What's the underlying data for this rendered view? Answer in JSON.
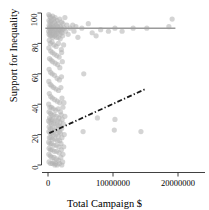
{
  "chart_data": {
    "type": "scatter",
    "title": "",
    "xlabel": "Total Campaign $",
    "ylabel": "Support for Inequality",
    "xlim": [
      -1200000,
      24000000
    ],
    "ylim": [
      -6,
      104
    ],
    "xticks": [
      0,
      10000000,
      20000000
    ],
    "xticklabels": [
      "0",
      "10000000",
      "20000000"
    ],
    "yticks": [
      0,
      20,
      40,
      60,
      80,
      100
    ],
    "yticklabels": [
      "0",
      "20",
      "40",
      "60",
      "80",
      "100"
    ],
    "grid": false,
    "legend": null,
    "point_color": "#b0b0b0",
    "point_opacity": 0.55,
    "point_radius": 2.6,
    "series": [
      {
        "name": "observations",
        "marker": "circle",
        "points": [
          [
            120000,
            99
          ],
          [
            250000,
            98
          ],
          [
            400000,
            97
          ],
          [
            700000,
            98
          ],
          [
            900000,
            96
          ],
          [
            1100000,
            97
          ],
          [
            1400000,
            95
          ],
          [
            1800000,
            96
          ],
          [
            2100000,
            94
          ],
          [
            2600000,
            97
          ],
          [
            150000,
            95
          ],
          [
            330000,
            94
          ],
          [
            520000,
            95
          ],
          [
            760000,
            93
          ],
          [
            1000000,
            94
          ],
          [
            1250000,
            92
          ],
          [
            1550000,
            93
          ],
          [
            1900000,
            91
          ],
          [
            2300000,
            93
          ],
          [
            2900000,
            92
          ],
          [
            180000,
            92
          ],
          [
            300000,
            91
          ],
          [
            480000,
            92
          ],
          [
            640000,
            90
          ],
          [
            850000,
            91
          ],
          [
            1150000,
            90
          ],
          [
            1450000,
            91
          ],
          [
            1700000,
            89
          ],
          [
            2000000,
            90
          ],
          [
            2500000,
            90
          ],
          [
            210000,
            90
          ],
          [
            360000,
            89
          ],
          [
            560000,
            90
          ],
          [
            800000,
            88
          ],
          [
            1050000,
            89
          ],
          [
            1300000,
            88
          ],
          [
            1600000,
            89
          ],
          [
            1950000,
            88
          ],
          [
            2200000,
            89
          ],
          [
            2700000,
            88
          ],
          [
            100000,
            88
          ],
          [
            280000,
            87
          ],
          [
            430000,
            88
          ],
          [
            690000,
            86
          ],
          [
            980000,
            87
          ],
          [
            1220000,
            86
          ],
          [
            1520000,
            87
          ],
          [
            1850000,
            86
          ],
          [
            2150000,
            87
          ],
          [
            3100000,
            86
          ],
          [
            160000,
            86
          ],
          [
            320000,
            85
          ],
          [
            500000,
            85
          ],
          [
            730000,
            84
          ],
          [
            1020000,
            85
          ],
          [
            1280000,
            84
          ],
          [
            1580000,
            84
          ],
          [
            1880000,
            83
          ],
          [
            2250000,
            85
          ],
          [
            3400000,
            90
          ],
          [
            3800000,
            92
          ],
          [
            4000000,
            88
          ],
          [
            4300000,
            91
          ],
          [
            4600000,
            84
          ],
          [
            5200000,
            90
          ],
          [
            6200000,
            93
          ],
          [
            6800000,
            87
          ],
          [
            7400000,
            85
          ],
          [
            8100000,
            89
          ],
          [
            9300000,
            88
          ],
          [
            10300000,
            90
          ],
          [
            11400000,
            88
          ],
          [
            13100000,
            90
          ],
          [
            15200000,
            90
          ],
          [
            18600000,
            91
          ],
          [
            19100000,
            96
          ],
          [
            190000,
            82
          ],
          [
            350000,
            80
          ],
          [
            620000,
            81
          ],
          [
            900000,
            79
          ],
          [
            1250000,
            78
          ],
          [
            1600000,
            80
          ],
          [
            2050000,
            76
          ],
          [
            2400000,
            79
          ],
          [
            140000,
            77
          ],
          [
            410000,
            75
          ],
          [
            660000,
            74
          ],
          [
            980000,
            73
          ],
          [
            1350000,
            72
          ],
          [
            1720000,
            71
          ],
          [
            2100000,
            74
          ],
          [
            230000,
            70
          ],
          [
            470000,
            69
          ],
          [
            720000,
            68
          ],
          [
            1100000,
            67
          ],
          [
            1480000,
            66
          ],
          [
            1820000,
            64
          ],
          [
            2200000,
            68
          ],
          [
            170000,
            63
          ],
          [
            390000,
            61
          ],
          [
            640000,
            60
          ],
          [
            1000000,
            59
          ],
          [
            1400000,
            57
          ],
          [
            1750000,
            56
          ],
          [
            2080000,
            58
          ],
          [
            5500000,
            60
          ],
          [
            130000,
            55
          ],
          [
            340000,
            53
          ],
          [
            580000,
            52
          ],
          [
            870000,
            51
          ],
          [
            1220000,
            50
          ],
          [
            1620000,
            49
          ],
          [
            1980000,
            51
          ],
          [
            200000,
            47
          ],
          [
            420000,
            45
          ],
          [
            670000,
            44
          ],
          [
            1030000,
            43
          ],
          [
            1420000,
            42
          ],
          [
            1800000,
            41
          ],
          [
            2150000,
            44
          ],
          [
            2450000,
            41
          ],
          [
            110000,
            40
          ],
          [
            300000,
            38
          ],
          [
            540000,
            38
          ],
          [
            810000,
            37
          ],
          [
            1180000,
            36
          ],
          [
            1560000,
            37
          ],
          [
            1920000,
            35
          ],
          [
            2300000,
            38
          ],
          [
            160000,
            35
          ],
          [
            370000,
            34
          ],
          [
            600000,
            33
          ],
          [
            930000,
            33
          ],
          [
            1300000,
            32
          ],
          [
            1680000,
            31
          ],
          [
            2030000,
            33
          ],
          [
            2600000,
            32
          ],
          [
            240000,
            31
          ],
          [
            460000,
            30
          ],
          [
            700000,
            30
          ],
          [
            1060000,
            29
          ],
          [
            1450000,
            29
          ],
          [
            1830000,
            28
          ],
          [
            2180000,
            30
          ],
          [
            7600000,
            31
          ],
          [
            10300000,
            30
          ],
          [
            100000,
            29
          ],
          [
            290000,
            28
          ],
          [
            520000,
            27
          ],
          [
            880000,
            27
          ],
          [
            1240000,
            26
          ],
          [
            1600000,
            26
          ],
          [
            1960000,
            25
          ],
          [
            2350000,
            27
          ],
          [
            180000,
            25
          ],
          [
            400000,
            24
          ],
          [
            650000,
            24
          ],
          [
            990000,
            23
          ],
          [
            1380000,
            23
          ],
          [
            1740000,
            22
          ],
          [
            2100000,
            24
          ],
          [
            5400000,
            22
          ],
          [
            10200000,
            23
          ],
          [
            14300000,
            22
          ],
          [
            140000,
            22
          ],
          [
            330000,
            21
          ],
          [
            570000,
            21
          ],
          [
            850000,
            20
          ],
          [
            1200000,
            20
          ],
          [
            1580000,
            19
          ],
          [
            1940000,
            21
          ],
          [
            2500000,
            20
          ],
          [
            210000,
            18
          ],
          [
            440000,
            18
          ],
          [
            690000,
            17
          ],
          [
            1060000,
            17
          ],
          [
            1430000,
            16
          ],
          [
            1790000,
            16
          ],
          [
            2140000,
            18
          ],
          [
            120000,
            15
          ],
          [
            310000,
            14
          ],
          [
            550000,
            14
          ],
          [
            900000,
            13
          ],
          [
            1270000,
            13
          ],
          [
            1650000,
            12
          ],
          [
            2000000,
            14
          ],
          [
            2420000,
            12
          ],
          [
            170000,
            11
          ],
          [
            380000,
            10
          ],
          [
            620000,
            10
          ],
          [
            960000,
            9
          ],
          [
            1330000,
            9
          ],
          [
            1700000,
            8
          ],
          [
            2060000,
            10
          ],
          [
            2300000,
            7
          ],
          [
            130000,
            7
          ],
          [
            350000,
            6
          ],
          [
            590000,
            5
          ],
          [
            920000,
            5
          ],
          [
            1290000,
            4
          ],
          [
            1620000,
            3
          ],
          [
            1980000,
            5
          ],
          [
            2250000,
            2
          ],
          [
            160000,
            2
          ],
          [
            400000,
            1
          ],
          [
            680000,
            1
          ],
          [
            1050000,
            0
          ],
          [
            1400000,
            0
          ],
          [
            1760000,
            1
          ],
          [
            2120000,
            0
          ],
          [
            900000,
            2
          ],
          [
            1150000,
            1
          ]
        ]
      }
    ],
    "lines": [
      {
        "name": "flat-reference-line",
        "style": "solid",
        "color": "#9a9a9a",
        "width": 1.4,
        "points": [
          [
            -400000,
            90
          ],
          [
            19600000,
            90
          ]
        ]
      },
      {
        "name": "regression-dashdot-line",
        "style": "dashdot",
        "color": "#1a1a1a",
        "width": 1.8,
        "points": [
          [
            200000,
            21
          ],
          [
            15000000,
            50
          ]
        ]
      }
    ]
  }
}
